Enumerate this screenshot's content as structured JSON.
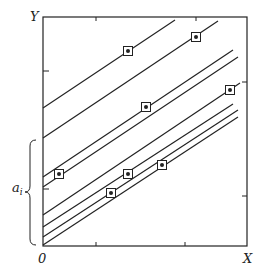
{
  "axes": {
    "y_label": "Y",
    "x_label": "X",
    "origin_label": "0",
    "brace_label": "a",
    "brace_subscript": "i"
  },
  "frame": {
    "left": 43,
    "top": 17,
    "right": 247,
    "bottom": 246
  },
  "ticks": {
    "x": [
      96,
      185
    ],
    "y": [
      71,
      189
    ],
    "top": [
      96,
      196
    ],
    "right": [
      82,
      196
    ]
  },
  "lines": [
    {
      "x1": 43,
      "y1": 108,
      "x2": 175,
      "y2": 20
    },
    {
      "x1": 43,
      "y1": 138,
      "x2": 218,
      "y2": 21
    },
    {
      "x1": 43,
      "y1": 177,
      "x2": 233,
      "y2": 50
    },
    {
      "x1": 43,
      "y1": 187,
      "x2": 238,
      "y2": 57
    },
    {
      "x1": 43,
      "y1": 215,
      "x2": 240,
      "y2": 83
    },
    {
      "x1": 43,
      "y1": 227,
      "x2": 233,
      "y2": 104
    },
    {
      "x1": 43,
      "y1": 237,
      "x2": 238,
      "y2": 110
    },
    {
      "x1": 43,
      "y1": 245,
      "x2": 238,
      "y2": 117
    }
  ],
  "markers": [
    {
      "x": 128,
      "y": 51
    },
    {
      "x": 196,
      "y": 37
    },
    {
      "x": 146,
      "y": 107
    },
    {
      "x": 230,
      "y": 90
    },
    {
      "x": 59,
      "y": 174
    },
    {
      "x": 128,
      "y": 174
    },
    {
      "x": 162,
      "y": 165
    },
    {
      "x": 111,
      "y": 193
    }
  ],
  "colors": {
    "ink": "#222222",
    "background": "#ffffff"
  }
}
